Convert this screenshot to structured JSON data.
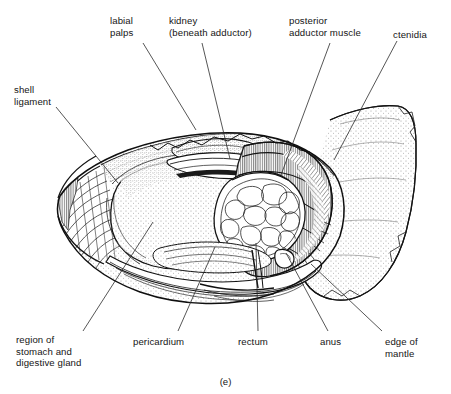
{
  "figure": {
    "caption": "(e)",
    "style": "pen-and-ink stipple line drawing",
    "ink_color": "#1a1a1a",
    "background_color": "#ffffff"
  },
  "labels": [
    {
      "name": "shell-ligament",
      "text": "shell\nligament",
      "x": 14,
      "y": 84,
      "leader": {
        "x1": 56,
        "y1": 107,
        "x2": 118,
        "y2": 183
      }
    },
    {
      "name": "labial-palps",
      "text": "labial\npalps",
      "x": 110,
      "y": 15,
      "leader": {
        "x1": 143,
        "y1": 43,
        "x2": 196,
        "y2": 130
      }
    },
    {
      "name": "kidney",
      "text": "kidney\n(beneath adductor)",
      "x": 169,
      "y": 15,
      "leader": {
        "x1": 202,
        "y1": 43,
        "x2": 230,
        "y2": 159
      }
    },
    {
      "name": "posterior-adductor-muscle",
      "text": "posterior\nadductor muscle",
      "x": 289,
      "y": 15,
      "leader": {
        "x1": 330,
        "y1": 43,
        "x2": 281,
        "y2": 175
      }
    },
    {
      "name": "ctenidia",
      "text": "ctenidia",
      "x": 393,
      "y": 29,
      "leader": {
        "x1": 397,
        "y1": 41,
        "x2": 334,
        "y2": 160
      }
    },
    {
      "name": "region-of-stomach-and-digestive-gland",
      "text": "region of\nstomach and\ndigestive gland",
      "x": 16,
      "y": 334,
      "leader": {
        "x1": 83,
        "y1": 331,
        "x2": 153,
        "y2": 222
      }
    },
    {
      "name": "pericardium",
      "text": "pericardium",
      "x": 133,
      "y": 336,
      "leader": {
        "x1": 178,
        "y1": 331,
        "x2": 215,
        "y2": 247
      }
    },
    {
      "name": "rectum",
      "text": "rectum",
      "x": 238,
      "y": 336,
      "leader": {
        "x1": 258,
        "y1": 331,
        "x2": 256,
        "y2": 243
      }
    },
    {
      "name": "anus",
      "text": "anus",
      "x": 320,
      "y": 336,
      "leader": {
        "x1": 328,
        "y1": 331,
        "x2": 286,
        "y2": 253
      }
    },
    {
      "name": "edge-of-mantle",
      "text": "edge of\nmantle",
      "x": 385,
      "y": 336,
      "leader": {
        "x1": 382,
        "y1": 331,
        "x2": 311,
        "y2": 264
      }
    }
  ]
}
